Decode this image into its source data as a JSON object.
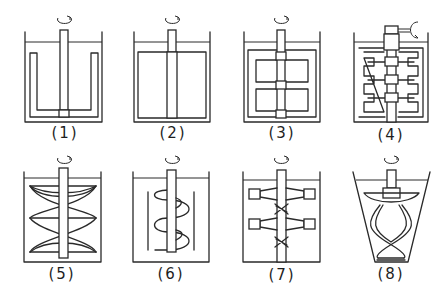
{
  "figure": {
    "line_color": "#2a2a2a",
    "background": "#ffffff",
    "panels": [
      {
        "id": 1,
        "label": "(1)",
        "type": "anchor impeller"
      },
      {
        "id": 2,
        "label": "(2)",
        "type": "paddle (gate) impeller"
      },
      {
        "id": 3,
        "label": "(3)",
        "type": "gate impeller with cross members"
      },
      {
        "id": 4,
        "label": "(4)",
        "type": "finger / comb-type impeller with drive"
      },
      {
        "id": 5,
        "label": "(5)",
        "type": "double helical ribbon impeller"
      },
      {
        "id": 6,
        "label": "(6)",
        "type": "helical screw impeller with baffles"
      },
      {
        "id": 7,
        "label": "(7)",
        "type": "multi-stage tapered paddle impeller"
      },
      {
        "id": 8,
        "label": "(8)",
        "type": "helical ribbon impeller in conical vessel"
      }
    ]
  }
}
